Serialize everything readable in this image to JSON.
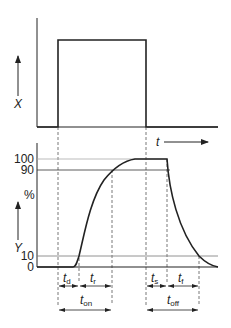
{
  "diagram": {
    "input_signal": {
      "axis_label": "X",
      "time_label": "t"
    },
    "output_signal": {
      "axis_label": "Y",
      "unit_label": "%",
      "y_ticks": [
        "100",
        "90",
        "10",
        "0"
      ]
    },
    "intervals": {
      "t_d": {
        "main": "t",
        "sub": "d"
      },
      "t_r": {
        "main": "t",
        "sub": "r"
      },
      "t_on": {
        "main": "t",
        "sub": "on"
      },
      "t_s": {
        "main": "t",
        "sub": "s"
      },
      "t_f": {
        "main": "t",
        "sub": "f"
      },
      "t_off": {
        "main": "t",
        "sub": "off"
      }
    },
    "colors": {
      "line": "#222222",
      "guide": "#888888",
      "dashed": "#555555"
    }
  }
}
